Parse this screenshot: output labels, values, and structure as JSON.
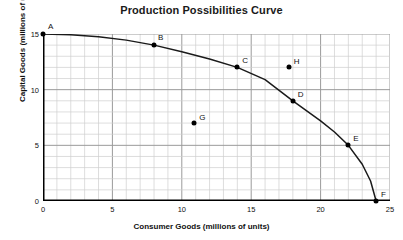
{
  "chart_data": {
    "type": "line",
    "title": "Production Possibilities Curve",
    "xlabel": "Consumer Goods (millions of units)",
    "ylabel": "Capital Goods (millions of units)",
    "xlim": [
      0,
      25
    ],
    "ylim": [
      0,
      15
    ],
    "xticks": [
      0,
      5,
      10,
      15,
      20,
      25
    ],
    "yticks": [
      0,
      5,
      10,
      15
    ],
    "grid": true,
    "grid_minor_step_x": 1,
    "grid_minor_step_y": 1,
    "grid_major_step_x": 5,
    "grid_major_step_y": 5,
    "legend": "none",
    "curve": {
      "name": "Production Possibilities Frontier",
      "x": [
        0,
        2,
        4,
        6,
        8,
        10,
        12,
        14,
        16,
        18,
        20,
        21,
        22,
        23,
        23.6,
        24
      ],
      "y": [
        15,
        14.93,
        14.75,
        14.45,
        14.0,
        13.4,
        12.75,
        12.0,
        10.9,
        9.0,
        7.2,
        6.2,
        5.0,
        3.3,
        1.8,
        0
      ]
    },
    "points": [
      {
        "label": "A",
        "x": 0,
        "y": 15,
        "position": "on-curve"
      },
      {
        "label": "B",
        "x": 8,
        "y": 14,
        "position": "on-curve"
      },
      {
        "label": "C",
        "x": 14,
        "y": 12,
        "position": "on-curve"
      },
      {
        "label": "D",
        "x": 18,
        "y": 9,
        "position": "on-curve"
      },
      {
        "label": "E",
        "x": 22,
        "y": 5,
        "position": "on-curve"
      },
      {
        "label": "F",
        "x": 24,
        "y": 0,
        "position": "on-curve"
      },
      {
        "label": "G",
        "x": 10.9,
        "y": 7,
        "position": "inside-curve"
      },
      {
        "label": "H",
        "x": 17.7,
        "y": 12,
        "position": "outside-curve"
      }
    ],
    "point_label_offsets": [
      {
        "label": "A",
        "dx": 5,
        "dy": -12
      },
      {
        "label": "B",
        "dx": 4,
        "dy": -12
      },
      {
        "label": "C",
        "dx": 5,
        "dy": -11
      },
      {
        "label": "D",
        "dx": 5,
        "dy": -11
      },
      {
        "label": "E",
        "dx": 5,
        "dy": -11
      },
      {
        "label": "F",
        "dx": 5,
        "dy": -11
      },
      {
        "label": "G",
        "dx": 5,
        "dy": -10
      },
      {
        "label": "H",
        "dx": 5,
        "dy": -10
      }
    ]
  },
  "colors": {
    "axis": "#000000",
    "curve": "#1a1a1a",
    "grid_minor": "#cfcfcf",
    "grid_major": "#9a9a9a",
    "point": "#000000",
    "background": "#ffffff",
    "text": "#111111"
  }
}
